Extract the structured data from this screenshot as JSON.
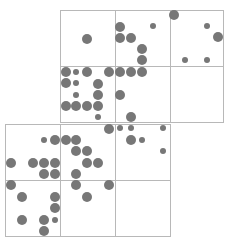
{
  "diagram": {
    "colors": {
      "grid": "#b8b8b8",
      "dot": "#777777",
      "background": "#ffffff"
    },
    "cells": [
      {
        "x": 60,
        "y": 10,
        "w": 55,
        "h": 56
      },
      {
        "x": 115,
        "y": 10,
        "w": 55,
        "h": 56
      },
      {
        "x": 170,
        "y": 10,
        "w": 53,
        "h": 56
      },
      {
        "x": 60,
        "y": 66,
        "w": 55,
        "h": 56
      },
      {
        "x": 115,
        "y": 66,
        "w": 55,
        "h": 56
      },
      {
        "x": 170,
        "y": 66,
        "w": 53,
        "h": 56
      },
      {
        "x": 5,
        "y": 124,
        "w": 55,
        "h": 56
      },
      {
        "x": 60,
        "y": 124,
        "w": 55,
        "h": 56
      },
      {
        "x": 115,
        "y": 124,
        "w": 55,
        "h": 56
      },
      {
        "x": 5,
        "y": 180,
        "w": 55,
        "h": 56
      },
      {
        "x": 60,
        "y": 180,
        "w": 55,
        "h": 56
      },
      {
        "x": 115,
        "y": 180,
        "w": 55,
        "h": 56
      }
    ],
    "dots": [
      [
        87,
        39,
        5
      ],
      [
        120,
        27,
        5
      ],
      [
        153,
        26,
        3
      ],
      [
        120,
        38,
        5
      ],
      [
        131,
        38,
        5
      ],
      [
        142,
        49,
        5
      ],
      [
        142,
        60,
        5
      ],
      [
        174,
        15,
        5
      ],
      [
        207,
        26,
        3
      ],
      [
        218,
        37,
        5
      ],
      [
        185,
        60,
        3
      ],
      [
        207,
        60,
        3
      ],
      [
        66,
        72,
        5
      ],
      [
        76,
        72,
        3
      ],
      [
        87,
        72,
        5
      ],
      [
        109,
        72,
        5
      ],
      [
        120,
        72,
        5
      ],
      [
        131,
        72,
        5
      ],
      [
        142,
        72,
        5
      ],
      [
        66,
        83,
        5
      ],
      [
        76,
        83,
        3
      ],
      [
        98,
        84,
        5
      ],
      [
        76,
        95,
        3
      ],
      [
        98,
        95,
        5
      ],
      [
        120,
        95,
        5
      ],
      [
        66,
        106,
        5
      ],
      [
        76,
        106,
        5
      ],
      [
        87,
        106,
        5
      ],
      [
        98,
        106,
        5
      ],
      [
        98,
        117,
        3
      ],
      [
        131,
        117,
        5
      ],
      [
        109,
        129,
        5
      ],
      [
        120,
        128,
        3
      ],
      [
        131,
        128,
        3
      ],
      [
        163,
        128,
        3
      ],
      [
        44,
        140,
        3
      ],
      [
        55,
        140,
        5
      ],
      [
        66,
        140,
        5
      ],
      [
        76,
        140,
        5
      ],
      [
        131,
        140,
        5
      ],
      [
        142,
        140,
        3
      ],
      [
        76,
        151,
        5
      ],
      [
        87,
        151,
        5
      ],
      [
        163,
        151,
        3
      ],
      [
        11,
        163,
        5
      ],
      [
        33,
        163,
        5
      ],
      [
        44,
        163,
        5
      ],
      [
        55,
        163,
        5
      ],
      [
        87,
        163,
        5
      ],
      [
        98,
        163,
        5
      ],
      [
        44,
        174,
        5
      ],
      [
        55,
        174,
        5
      ],
      [
        76,
        174,
        5
      ],
      [
        11,
        185,
        5
      ],
      [
        76,
        185,
        5
      ],
      [
        109,
        185,
        5
      ],
      [
        22,
        197,
        5
      ],
      [
        55,
        197,
        5
      ],
      [
        87,
        197,
        5
      ],
      [
        55,
        208,
        5
      ],
      [
        22,
        220,
        5
      ],
      [
        44,
        220,
        5
      ],
      [
        55,
        220,
        3
      ],
      [
        44,
        231,
        5
      ]
    ]
  }
}
